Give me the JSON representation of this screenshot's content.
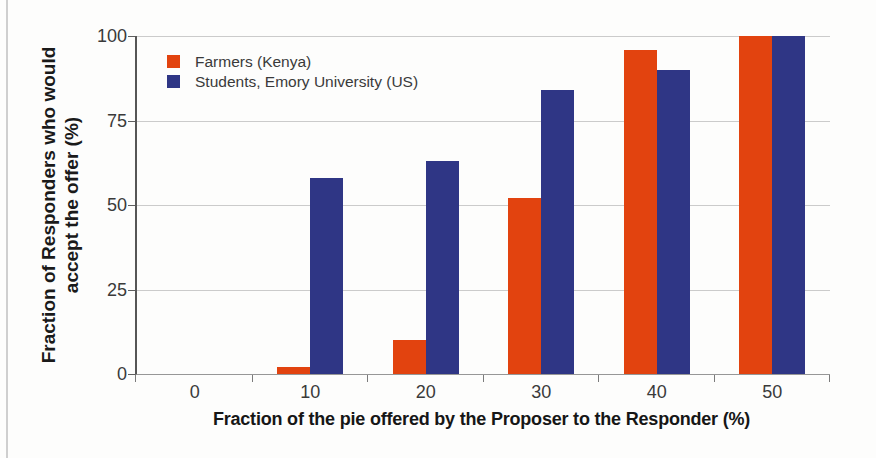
{
  "figure": {
    "background": "#fdfdfc"
  },
  "chart_data": {
    "type": "bar",
    "categories": [
      "0",
      "10",
      "20",
      "30",
      "40",
      "50"
    ],
    "series": [
      {
        "key": "farmers",
        "name": "Farmers (Kenya)",
        "color": "#e2430f",
        "values": [
          0,
          2,
          10,
          52,
          96,
          100
        ]
      },
      {
        "key": "students",
        "name": "Students, Emory University (US)",
        "color": "#2f3685",
        "values": [
          0,
          58,
          63,
          84,
          90,
          100
        ]
      }
    ],
    "xlabel": "Fraction of the pie offered by the Proposer to the Responder (%)",
    "ylabel_line1": "Fraction of Responders who would",
    "ylabel_line2": "accept the offer (%)",
    "yticks": [
      0,
      25,
      50,
      75,
      100
    ],
    "ylim": [
      0,
      100
    ],
    "grid": "horizontal",
    "legend_position": "top-left"
  }
}
